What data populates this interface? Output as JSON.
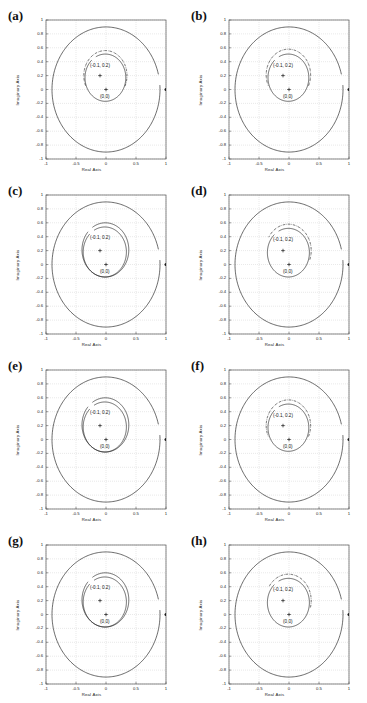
{
  "figure": {
    "panel_count": 8,
    "columns": 2,
    "rows": 4
  },
  "axes": {
    "xlabel": "Real Axis",
    "ylabel": "Imaginary Axis",
    "xticks": [
      "-1",
      "-0.5",
      "0",
      "0.5",
      "1"
    ],
    "xtick_values": [
      -1,
      -0.5,
      0,
      0.5,
      1
    ],
    "yticks": [
      "1",
      "0.8",
      "0.6",
      "0.4",
      "0.2",
      "0",
      "-0.2",
      "-0.4",
      "-0.6",
      "-0.8",
      "-1"
    ],
    "ytick_values": [
      1,
      0.8,
      0.6,
      0.4,
      0.2,
      0,
      -0.2,
      -0.4,
      -0.6,
      -0.8,
      -1
    ],
    "xlim": [
      -1,
      1
    ],
    "ylim": [
      -1,
      1
    ],
    "grid": "dotted"
  },
  "annotations": {
    "center_upper": "(-0.1, 0.2)",
    "center_lower": "(0,0)",
    "center_upper_value": [
      -0.1,
      0.2
    ],
    "center_lower_value": [
      0,
      0
    ]
  },
  "colors": {
    "curve": "#1a1a1a",
    "grid": "#b4b4b4",
    "frame": "#555555",
    "text": "#111111"
  },
  "chart_data": {
    "type": "scatter",
    "title": "",
    "xlabel": "Real Axis",
    "ylabel": "Imaginary Axis",
    "xlim": [
      -1,
      1
    ],
    "ylim": [
      -1,
      1
    ],
    "grid": true,
    "legend": "none",
    "panels": [
      {
        "label": "(a)",
        "curves": [
          {
            "name": "outer-locus-solid",
            "shape": "circle",
            "cx": 0.0,
            "cy": 0.0,
            "r": 0.9,
            "style": "solid",
            "gap_deg": [
              4,
              14
            ]
          },
          {
            "name": "inner-locus-solid",
            "shape": "circle",
            "cx": -0.01,
            "cy": 0.17,
            "r": 0.34,
            "style": "solid",
            "gap_deg": [
              118,
              132
            ]
          },
          {
            "name": "inner-locus-dashdot",
            "shape": "circle",
            "cx": -0.01,
            "cy": 0.2,
            "r": 0.36,
            "style": "dashdot",
            "gap_deg": [
              205,
              335
            ]
          }
        ],
        "markers": [
          {
            "name": "pole-origin",
            "x": 0.0,
            "y": 0.0,
            "glyph": "plus"
          },
          {
            "name": "pole-offset",
            "x": -0.1,
            "y": 0.2,
            "glyph": "plus"
          },
          {
            "name": "unit-point",
            "x": 1.0,
            "y": 0.0,
            "glyph": "dot"
          }
        ],
        "labels": [
          {
            "text": "(-0.1, 0.2)",
            "x": -0.1,
            "y": 0.33
          },
          {
            "text": "(0,0)",
            "x": -0.02,
            "y": -0.12
          }
        ]
      },
      {
        "label": "(b)",
        "curves": [
          {
            "name": "outer-locus-solid",
            "shape": "circle",
            "cx": 0.0,
            "cy": 0.0,
            "r": 0.9,
            "style": "solid",
            "gap_deg": [
              4,
              14
            ]
          },
          {
            "name": "inner-locus-solid",
            "shape": "circle",
            "cx": -0.01,
            "cy": 0.17,
            "r": 0.34,
            "style": "solid",
            "gap_deg": [
              118,
              132
            ]
          },
          {
            "name": "inner-locus-dashdot",
            "shape": "circle",
            "cx": -0.01,
            "cy": 0.21,
            "r": 0.37,
            "style": "dashdot",
            "gap_deg": [
              205,
              335
            ]
          }
        ],
        "markers": [
          {
            "name": "pole-origin",
            "x": 0.0,
            "y": 0.0,
            "glyph": "plus"
          },
          {
            "name": "pole-offset",
            "x": -0.1,
            "y": 0.2,
            "glyph": "plus"
          },
          {
            "name": "unit-point",
            "x": 1.0,
            "y": 0.0,
            "glyph": "dot"
          }
        ],
        "labels": [
          {
            "text": "(-0.1, 0.2)",
            "x": -0.1,
            "y": 0.33
          },
          {
            "text": "(0,0)",
            "x": -0.02,
            "y": -0.12
          }
        ]
      },
      {
        "label": "(c)",
        "curves": [
          {
            "name": "outer-locus-solid",
            "shape": "circle",
            "cx": 0.0,
            "cy": 0.0,
            "r": 0.9,
            "style": "solid",
            "gap_deg": [
              4,
              14
            ]
          },
          {
            "name": "inner-locus-solid",
            "shape": "circle",
            "cx": -0.02,
            "cy": 0.18,
            "r": 0.36,
            "style": "solid",
            "gap_deg": [
              120,
              134
            ]
          },
          {
            "name": "inner-locus-dashdot",
            "shape": "circle",
            "cx": -0.01,
            "cy": 0.21,
            "r": 0.39,
            "style": "solid",
            "gap_deg": [
              124,
              138
            ]
          }
        ],
        "markers": [
          {
            "name": "pole-origin",
            "x": 0.0,
            "y": 0.0,
            "glyph": "plus"
          },
          {
            "name": "pole-offset",
            "x": -0.1,
            "y": 0.2,
            "glyph": "plus"
          },
          {
            "name": "unit-point",
            "x": 1.0,
            "y": 0.0,
            "glyph": "dot"
          }
        ],
        "labels": [
          {
            "text": "(-0.1, 0.2)",
            "x": -0.1,
            "y": 0.36
          },
          {
            "text": "(0,0)",
            "x": -0.02,
            "y": -0.12
          }
        ]
      },
      {
        "label": "(d)",
        "curves": [
          {
            "name": "outer-locus-solid",
            "shape": "circle",
            "cx": 0.0,
            "cy": 0.0,
            "r": 0.9,
            "style": "solid",
            "gap_deg": [
              4,
              14
            ]
          },
          {
            "name": "inner-locus-solid",
            "shape": "circle",
            "cx": -0.01,
            "cy": 0.17,
            "r": 0.35,
            "style": "solid",
            "gap_deg": [
              118,
              132
            ]
          },
          {
            "name": "inner-locus-dashdot",
            "shape": "circle",
            "cx": -0.01,
            "cy": 0.2,
            "r": 0.38,
            "style": "dashdot",
            "gap_deg": [
              150,
              340
            ]
          }
        ],
        "markers": [
          {
            "name": "pole-origin",
            "x": 0.0,
            "y": 0.0,
            "glyph": "plus"
          },
          {
            "name": "pole-offset",
            "x": -0.1,
            "y": 0.2,
            "glyph": "plus"
          },
          {
            "name": "unit-point",
            "x": 1.0,
            "y": 0.0,
            "glyph": "dot"
          }
        ],
        "labels": [
          {
            "text": "(-0.1, 0.2)",
            "x": -0.1,
            "y": 0.34
          },
          {
            "text": "(0,0)",
            "x": -0.02,
            "y": -0.12
          }
        ]
      },
      {
        "label": "(e)",
        "curves": [
          {
            "name": "outer-locus-solid",
            "shape": "circle",
            "cx": 0.0,
            "cy": 0.0,
            "r": 0.9,
            "style": "solid",
            "gap_deg": [
              4,
              14
            ]
          },
          {
            "name": "inner-locus-solid",
            "shape": "circle",
            "cx": -0.02,
            "cy": 0.18,
            "r": 0.36,
            "style": "solid",
            "gap_deg": [
              120,
              134
            ]
          },
          {
            "name": "inner-locus-dashdot",
            "shape": "circle",
            "cx": -0.01,
            "cy": 0.21,
            "r": 0.39,
            "style": "solid",
            "gap_deg": [
              124,
              138
            ]
          }
        ],
        "markers": [
          {
            "name": "pole-origin",
            "x": 0.0,
            "y": 0.0,
            "glyph": "plus"
          },
          {
            "name": "pole-offset",
            "x": -0.1,
            "y": 0.2,
            "glyph": "plus"
          },
          {
            "name": "unit-point",
            "x": 1.0,
            "y": 0.0,
            "glyph": "dot"
          }
        ],
        "labels": [
          {
            "text": "(-0.1, 0.2)",
            "x": -0.1,
            "y": 0.36
          },
          {
            "text": "(0,0)",
            "x": -0.02,
            "y": -0.12
          }
        ]
      },
      {
        "label": "(f)",
        "curves": [
          {
            "name": "outer-locus-solid",
            "shape": "circle",
            "cx": 0.0,
            "cy": 0.0,
            "r": 0.9,
            "style": "solid",
            "gap_deg": [
              4,
              14
            ]
          },
          {
            "name": "inner-locus-solid",
            "shape": "circle",
            "cx": -0.01,
            "cy": 0.17,
            "r": 0.34,
            "style": "solid",
            "gap_deg": [
              118,
              132
            ]
          },
          {
            "name": "inner-locus-dashdot",
            "shape": "circle",
            "cx": -0.01,
            "cy": 0.2,
            "r": 0.37,
            "style": "dashdot",
            "gap_deg": [
              205,
              335
            ]
          }
        ],
        "markers": [
          {
            "name": "pole-origin",
            "x": 0.0,
            "y": 0.0,
            "glyph": "plus"
          },
          {
            "name": "pole-offset",
            "x": -0.1,
            "y": 0.2,
            "glyph": "plus"
          },
          {
            "name": "unit-point",
            "x": 1.0,
            "y": 0.0,
            "glyph": "dot"
          }
        ],
        "labels": [
          {
            "text": "(-0.1, 0.2)",
            "x": -0.1,
            "y": 0.33
          },
          {
            "text": "(0,0)",
            "x": -0.02,
            "y": -0.12
          }
        ]
      },
      {
        "label": "(g)",
        "curves": [
          {
            "name": "outer-locus-solid",
            "shape": "circle",
            "cx": 0.0,
            "cy": 0.0,
            "r": 0.9,
            "style": "solid",
            "gap_deg": [
              4,
              14
            ]
          },
          {
            "name": "inner-locus-solid",
            "shape": "circle",
            "cx": -0.02,
            "cy": 0.18,
            "r": 0.36,
            "style": "solid",
            "gap_deg": [
              120,
              134
            ]
          },
          {
            "name": "inner-locus-dashdot",
            "shape": "circle",
            "cx": -0.01,
            "cy": 0.21,
            "r": 0.39,
            "style": "solid",
            "gap_deg": [
              124,
              138
            ]
          }
        ],
        "markers": [
          {
            "name": "pole-origin",
            "x": 0.0,
            "y": 0.0,
            "glyph": "plus"
          },
          {
            "name": "pole-offset",
            "x": -0.1,
            "y": 0.2,
            "glyph": "plus"
          },
          {
            "name": "unit-point",
            "x": 1.0,
            "y": 0.0,
            "glyph": "dot"
          }
        ],
        "labels": [
          {
            "text": "(-0.1, 0.2)",
            "x": -0.1,
            "y": 0.36
          },
          {
            "text": "(0,0)",
            "x": -0.02,
            "y": -0.12
          }
        ]
      },
      {
        "label": "(h)",
        "curves": [
          {
            "name": "outer-locus-solid",
            "shape": "circle",
            "cx": 0.0,
            "cy": 0.0,
            "r": 0.9,
            "style": "solid",
            "gap_deg": [
              4,
              14
            ]
          },
          {
            "name": "inner-locus-solid",
            "shape": "circle",
            "cx": -0.01,
            "cy": 0.17,
            "r": 0.35,
            "style": "solid",
            "gap_deg": [
              118,
              132
            ]
          },
          {
            "name": "inner-locus-dashdot",
            "shape": "circle",
            "cx": -0.01,
            "cy": 0.2,
            "r": 0.38,
            "style": "dashdot",
            "gap_deg": [
              150,
              345
            ]
          }
        ],
        "markers": [
          {
            "name": "pole-origin",
            "x": 0.0,
            "y": 0.0,
            "glyph": "plus"
          },
          {
            "name": "pole-offset",
            "x": -0.1,
            "y": 0.2,
            "glyph": "plus"
          },
          {
            "name": "unit-point",
            "x": 1.0,
            "y": 0.0,
            "glyph": "dot"
          }
        ],
        "labels": [
          {
            "text": "(-0.1, 0.2)",
            "x": -0.1,
            "y": 0.34
          },
          {
            "text": "(0,0)",
            "x": -0.02,
            "y": -0.12
          }
        ]
      }
    ]
  }
}
